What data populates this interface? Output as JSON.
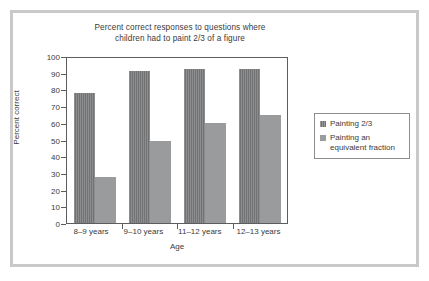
{
  "chart_data": {
    "type": "bar",
    "title": "Percent correct responses to questions where children had to paint 2/3 of a figure",
    "title_line_1": "Percent correct responses to questions where",
    "title_line_2": "children had to paint 2/3 of a figure",
    "xlabel": "Age",
    "ylabel": "Percent correct",
    "ylim": [
      0,
      100
    ],
    "ytick_step": 10,
    "yticks": [
      100,
      90,
      80,
      70,
      60,
      50,
      40,
      30,
      20,
      10,
      0
    ],
    "grid": false,
    "legend_position": "right",
    "categories": [
      "8–9 years",
      "9–10 years",
      "11–12 years",
      "12–13 years"
    ],
    "series": [
      {
        "name": "Painting 2/3",
        "color": "#77787a",
        "values": [
          78,
          91,
          92.5,
          92.5
        ]
      },
      {
        "name": "Painting an\nequivalent fraction",
        "color": "#9a9b9d",
        "values": [
          27.5,
          49,
          60,
          64.5
        ]
      }
    ]
  },
  "legend": {
    "entries": [
      {
        "label": "Painting 2/3"
      },
      {
        "label": "Painting an\nequivalent fraction"
      }
    ]
  },
  "colors": {
    "series_dark": "#77787a",
    "series_light": "#9a9b9d",
    "axis": "#5d5d5d",
    "text": "#3a3a3a",
    "outer_frame": "#c9c9c9",
    "legend_border": "#8d8d8d",
    "background": "#ffffff"
  }
}
